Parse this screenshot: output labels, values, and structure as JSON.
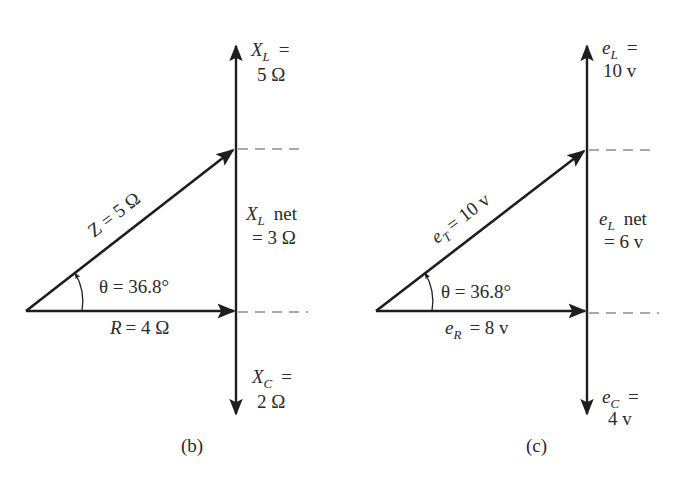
{
  "colors": {
    "stroke": "#1e1e1e",
    "dash": "#555555",
    "text": "#2a2a2a",
    "background": "#ffffff"
  },
  "diagrams": [
    {
      "caption": "(b)",
      "title": "Impedance phasor diagram",
      "top_label": {
        "sym": "X",
        "sub": "L",
        "eq": "=",
        "value": "5 Ω"
      },
      "net_label": {
        "sym": "X",
        "sub": "L",
        "word": "net",
        "value": "= 3 Ω"
      },
      "bottom_label": {
        "sym": "X",
        "sub": "C",
        "eq": "=",
        "value": "2 Ω"
      },
      "hyp_label": "Z = 5 Ω",
      "base_label": {
        "sym": "R",
        "value": "= 4 Ω"
      },
      "angle_label": "θ = 36.8°"
    },
    {
      "caption": "(c)",
      "title": "Voltage phasor diagram",
      "top_label": {
        "sym": "e",
        "sub": "L",
        "eq": "=",
        "value": "10 v"
      },
      "net_label": {
        "sym": "e",
        "sub": "L",
        "word": "net",
        "value": "= 6 v"
      },
      "bottom_label": {
        "sym": "e",
        "sub": "C",
        "eq": "=",
        "value": "4 v"
      },
      "hyp_label": {
        "sym": "e",
        "sub": "T",
        "value": "= 10 v"
      },
      "base_label": {
        "sym": "e",
        "sub": "R",
        "value": "= 8 v"
      },
      "angle_label": "θ = 36.8°"
    }
  ]
}
